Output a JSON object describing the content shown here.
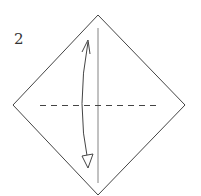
{
  "diagram": {
    "step_number": "2",
    "shape": "square-rotated-45",
    "fold_line": "valley-fold-horizontal",
    "crease": "vertical-center-crease",
    "arrow": "fold-and-unfold-vertical",
    "colors": {
      "stroke": "#444444",
      "background": "#ffffff"
    }
  }
}
